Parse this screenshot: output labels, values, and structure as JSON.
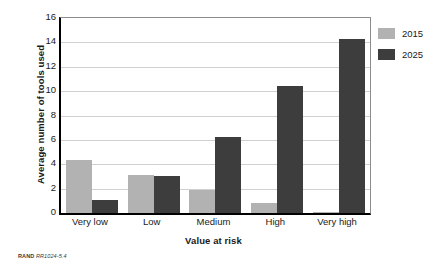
{
  "chart_data": {
    "type": "bar",
    "title": "",
    "categories": [
      "Very low",
      "Low",
      "Medium",
      "High",
      "Very high"
    ],
    "series": [
      {
        "name": "2015",
        "color": "#b2b2b2",
        "values": [
          4.35,
          3.15,
          1.9,
          0.8,
          0.1
        ]
      },
      {
        "name": "2025",
        "color": "#3d3d3d",
        "values": [
          1.05,
          3.05,
          6.2,
          10.4,
          14.3
        ]
      }
    ],
    "xlabel": "Value at risk",
    "ylabel": "Average number of tools used",
    "ylim": [
      0,
      16
    ],
    "yticks": [
      0,
      2,
      4,
      6,
      8,
      10,
      12,
      14,
      16
    ],
    "ytick_labels": [
      "0",
      "2",
      "4",
      "6",
      "8",
      "10",
      "12",
      "14",
      "16"
    ],
    "grid": "horizontal",
    "legend_position": "right"
  },
  "legend": {
    "entries": [
      {
        "label": "2015",
        "color": "#b2b2b2"
      },
      {
        "label": "2025",
        "color": "#3d3d3d"
      }
    ]
  },
  "footer": {
    "brand": "RAND",
    "code": "RR1024-5.4"
  }
}
